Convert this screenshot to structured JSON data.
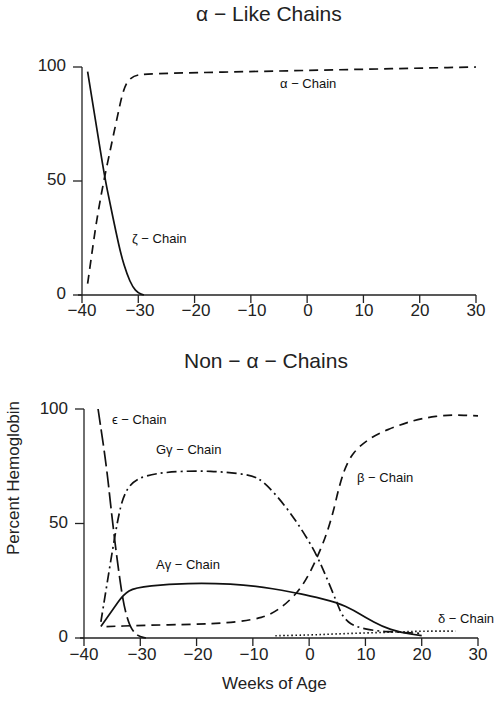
{
  "figure": {
    "ylabel": "Percent Hemoglobin",
    "xlabel": "Weeks of Age"
  },
  "chart_data": [
    {
      "type": "line",
      "title": "α − Like Chains",
      "xlabel": "Weeks of Age",
      "ylabel": "Percent Hemoglobin",
      "xlim": [
        -40,
        30
      ],
      "ylim": [
        0,
        100
      ],
      "x_ticks": [
        "−40",
        "−30",
        "−20",
        "−10",
        "0",
        "10",
        "20",
        "30"
      ],
      "y_ticks": [
        "0",
        "50",
        "100"
      ],
      "grid": false,
      "legend": "inline labels",
      "series": [
        {
          "name": "α − Chain",
          "style": "dashed",
          "points": [
            [
              -39,
              5
            ],
            [
              -37,
              40
            ],
            [
              -34,
              75
            ],
            [
              -32.5,
              92
            ],
            [
              -31,
              96
            ],
            [
              -29,
              97
            ],
            [
              -20,
              97.5
            ],
            [
              -10,
              98
            ],
            [
              0,
              98.5
            ],
            [
              10,
              99
            ],
            [
              20,
              99.5
            ],
            [
              30,
              100
            ]
          ]
        },
        {
          "name": "ζ − Chain",
          "style": "solid",
          "points": [
            [
              -39,
              98
            ],
            [
              -37.5,
              75
            ],
            [
              -36,
              52
            ],
            [
              -35,
              40
            ],
            [
              -34,
              28
            ],
            [
              -33,
              17
            ],
            [
              -32,
              9
            ],
            [
              -31,
              3.5
            ],
            [
              -30,
              0.8
            ],
            [
              -29,
              0
            ]
          ]
        }
      ]
    },
    {
      "type": "line",
      "title": "Non − α − Chains",
      "xlabel": "Weeks of Age",
      "ylabel": "Percent Hemoglobin",
      "xlim": [
        -40,
        30
      ],
      "ylim": [
        0,
        100
      ],
      "x_ticks": [
        "−40",
        "−30",
        "−20",
        "−10",
        "0",
        "10",
        "20",
        "30"
      ],
      "y_ticks": [
        "0",
        "50",
        "100"
      ],
      "grid": false,
      "legend": "inline labels",
      "series": [
        {
          "name": "ε − Chain",
          "style": "long-dashed",
          "points": [
            [
              -37.5,
              100
            ],
            [
              -36,
              75
            ],
            [
              -35,
              52
            ],
            [
              -34,
              32
            ],
            [
              -33,
              15
            ],
            [
              -32,
              6
            ],
            [
              -31,
              2
            ],
            [
              -30,
              0.5
            ],
            [
              -29,
              0
            ]
          ]
        },
        {
          "name": "Gγ − Chain",
          "style": "dash-dot",
          "points": [
            [
              -37,
              7
            ],
            [
              -35.5,
              30
            ],
            [
              -34,
              52
            ],
            [
              -33,
              62
            ],
            [
              -31.5,
              68
            ],
            [
              -29,
              71
            ],
            [
              -25,
              72.5
            ],
            [
              -20,
              73
            ],
            [
              -15,
              72.5
            ],
            [
              -10,
              71
            ],
            [
              -8,
              68
            ],
            [
              -5,
              60
            ],
            [
              -2,
              50
            ],
            [
              1,
              38
            ],
            [
              3,
              27
            ],
            [
              5,
              15
            ],
            [
              6,
              9
            ],
            [
              8,
              5
            ],
            [
              12,
              3
            ],
            [
              16,
              2.5
            ],
            [
              20,
              2
            ]
          ]
        },
        {
          "name": "Aγ − Chain",
          "style": "solid",
          "points": [
            [
              -37,
              5
            ],
            [
              -35,
              12
            ],
            [
              -33,
              19
            ],
            [
              -31,
              22
            ],
            [
              -25,
              23.5
            ],
            [
              -18,
              24
            ],
            [
              -10,
              23
            ],
            [
              -3,
              20
            ],
            [
              0,
              18.5
            ],
            [
              5,
              15.5
            ],
            [
              8,
              12
            ],
            [
              10,
              9
            ],
            [
              13,
              5
            ],
            [
              16,
              2.5
            ],
            [
              20,
              1
            ]
          ]
        },
        {
          "name": "β − Chain",
          "style": "dashed",
          "points": [
            [
              -36,
              5
            ],
            [
              -30,
              5.5
            ],
            [
              -20,
              6
            ],
            [
              -15,
              6.5
            ],
            [
              -10,
              8
            ],
            [
              -7,
              10
            ],
            [
              -4,
              15
            ],
            [
              -1,
              23
            ],
            [
              2,
              38
            ],
            [
              4,
              52
            ],
            [
              5.5,
              68
            ],
            [
              7,
              78
            ],
            [
              9,
              84
            ],
            [
              12,
              89
            ],
            [
              16,
              93
            ],
            [
              20,
              96
            ],
            [
              25,
              97.5
            ],
            [
              30,
              97
            ]
          ]
        },
        {
          "name": "δ − Chain",
          "style": "dotted",
          "points": [
            [
              -6,
              1
            ],
            [
              0,
              1.3
            ],
            [
              5,
              1.8
            ],
            [
              10,
              2.2
            ],
            [
              15,
              2.6
            ],
            [
              20,
              3
            ],
            [
              26,
              3
            ]
          ]
        }
      ]
    }
  ],
  "panels": {
    "top": {
      "title": "α − Like Chains",
      "labels": {
        "alpha": "α − Chain",
        "zeta": "ζ − Chain"
      }
    },
    "bottom": {
      "title": "Non − α − Chains",
      "labels": {
        "epsilon": "ϵ − Chain",
        "ggamma": "Gγ − Chain",
        "agamma": "Aγ − Chain",
        "beta": "β − Chain",
        "delta": "δ − Chain"
      }
    }
  },
  "ticks": {
    "x": [
      "−40",
      "−30",
      "−20",
      "−10",
      "0",
      "10",
      "20",
      "30"
    ],
    "y": {
      "t0": "0",
      "t50": "50",
      "t100": "100"
    }
  }
}
